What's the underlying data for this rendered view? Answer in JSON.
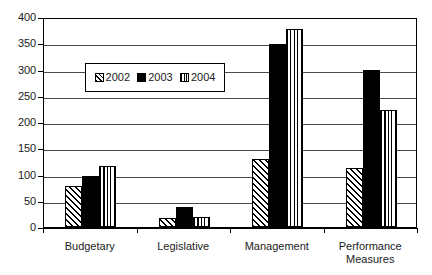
{
  "chart_data": {
    "type": "bar",
    "title": "",
    "subtitle": "",
    "xlabel": "",
    "ylabel": "",
    "ylim": [
      0,
      400
    ],
    "ytick_step": 50,
    "yticks": [
      0,
      50,
      100,
      150,
      200,
      250,
      300,
      350,
      400
    ],
    "ytick_labels": [
      "0",
      "50",
      "100",
      "150",
      "200",
      "250",
      "300",
      "350",
      "400"
    ],
    "grid": true,
    "grid_axis": "y",
    "legend_position": "inside-upper-left",
    "categories": [
      "Budgetary",
      "Legislative",
      "Management",
      "Performance Measures"
    ],
    "category_labels": [
      [
        "Budgetary"
      ],
      [
        "Legislative"
      ],
      [
        "Management"
      ],
      [
        "Performance",
        "Measures"
      ]
    ],
    "series": [
      {
        "name": "2002",
        "pattern": "diagonal-hatch",
        "color": "#000000",
        "values": [
          78,
          17,
          130,
          112
        ]
      },
      {
        "name": "2003",
        "pattern": "solid",
        "color": "#000000",
        "values": [
          97,
          38,
          348,
          300
        ]
      },
      {
        "name": "2004",
        "pattern": "vertical-lines",
        "color": "#000000",
        "values": [
          117,
          20,
          378,
          223
        ]
      }
    ]
  },
  "legend": {
    "entries": [
      {
        "label": "2002",
        "swatch": "diagonal-hatch-swatch"
      },
      {
        "label": "2003",
        "swatch": "solid-black-swatch"
      },
      {
        "label": "2004",
        "swatch": "vertical-lines-swatch"
      }
    ]
  },
  "axes": {
    "y_labels": [
      "400",
      "350",
      "300",
      "250",
      "200",
      "150",
      "100",
      "50",
      "0"
    ],
    "x_labels": [
      "Budgetary",
      "Legislative",
      "Management",
      "Performance Measures"
    ]
  },
  "colors": {
    "frame": "#000000",
    "gridline": "#4a4a4a",
    "text": "#1a1a1a",
    "background": "#ffffff"
  }
}
